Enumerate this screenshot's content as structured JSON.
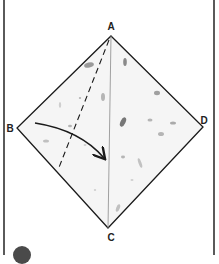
{
  "diagram": {
    "type": "origami-fold-instruction",
    "vertices": [
      {
        "id": "A",
        "label": "A",
        "x": 111,
        "y": 36,
        "label_x": 111,
        "label_y": 27
      },
      {
        "id": "B",
        "label": "B",
        "x": 17,
        "y": 128,
        "label_x": 10,
        "label_y": 129
      },
      {
        "id": "C",
        "label": "C",
        "x": 108,
        "y": 228,
        "label_x": 111,
        "label_y": 238
      },
      {
        "id": "D",
        "label": "D",
        "x": 203,
        "y": 127,
        "label_x": 204,
        "label_y": 121
      }
    ],
    "edges": [
      {
        "from": "A",
        "to": "B",
        "style": "solid"
      },
      {
        "from": "B",
        "to": "C",
        "style": "solid"
      },
      {
        "from": "C",
        "to": "D",
        "style": "solid"
      },
      {
        "from": "D",
        "to": "A",
        "style": "solid"
      }
    ],
    "center_crease": {
      "from": "A",
      "to": "C",
      "style": "thin-solid"
    },
    "fold_line": {
      "x1": 109,
      "y1": 40,
      "x2": 58,
      "y2": 170,
      "style": "dashed",
      "meaning": "valley fold"
    },
    "fold_arrow": {
      "from": "B-side",
      "to": "center crease AC",
      "start_x": 35,
      "start_y": 123,
      "end_x": 104,
      "end_y": 158
    },
    "paper_color": "#f4f4f4",
    "line_color": "#1a1a1a",
    "step_badge_color": "#4a4a4a"
  }
}
